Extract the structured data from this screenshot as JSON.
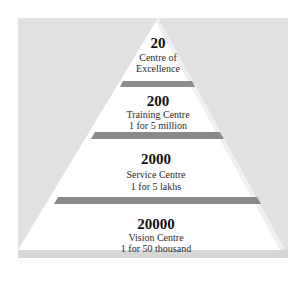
{
  "diagram": {
    "type": "pyramid",
    "colors": {
      "background_box": "#e1e1e1",
      "pyramid_fill": "#ffffff",
      "separator": "#8c8c8c",
      "text": "#1a1a1a"
    },
    "levels": [
      {
        "count": "20",
        "label": "Centre of",
        "label2": "Excellence"
      },
      {
        "count": "200",
        "label": "Training Centre",
        "label2": "1 for 5 million"
      },
      {
        "count": "2000",
        "label": "Service Centre",
        "label2": "1 for 5 lakhs"
      },
      {
        "count": "20000",
        "label": "Vision Centre",
        "label2": "1 for 50 thousand"
      }
    ]
  }
}
